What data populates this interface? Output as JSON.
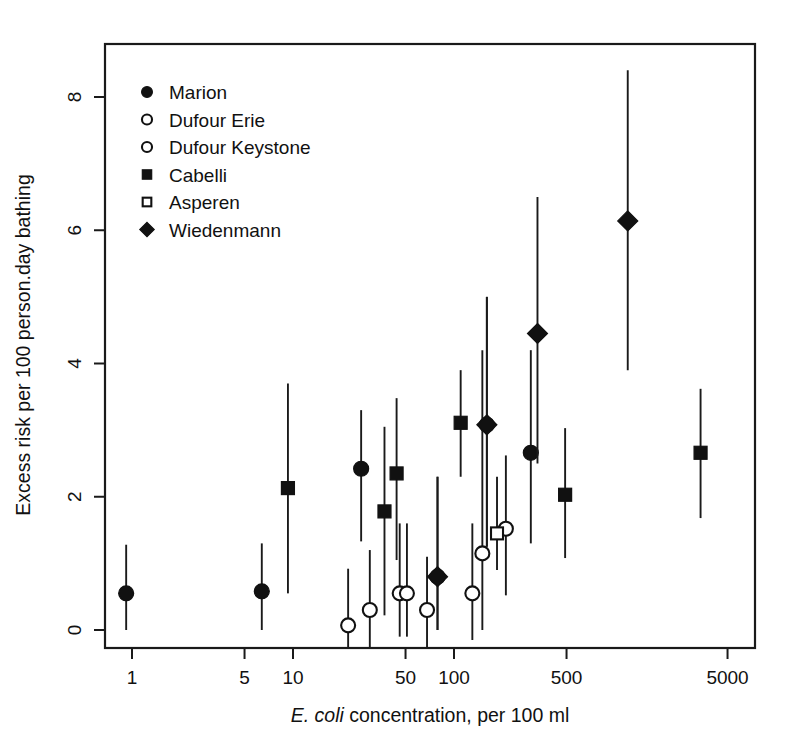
{
  "chart_data": {
    "type": "scatter",
    "title": "",
    "xlabel": "E. coli concentration, per 100 ml",
    "xlabel_italic_part": "E. coli",
    "xlabel_rest": " concentration, per 100 ml",
    "ylabel": "Excess risk per 100 person.day bathing",
    "xscale": "log",
    "yscale": "linear",
    "xlim": [
      0.62,
      8000
    ],
    "ylim": [
      -0.55,
      9.05
    ],
    "xticks": [
      1,
      5,
      10,
      50,
      100,
      500,
      5000
    ],
    "xticklabels": [
      "1",
      "5",
      "10",
      "50",
      "100",
      "500",
      "5000"
    ],
    "yticks": [
      0,
      2,
      4,
      6,
      8
    ],
    "yticklabels": [
      "0",
      "2",
      "4",
      "6",
      "8"
    ],
    "grid": false,
    "errorbars": "vertical 95% confidence intervals",
    "legend_position": "top-left inside plot",
    "series": [
      {
        "name": "Marion",
        "marker": "filled-circle",
        "points": [
          {
            "x": 0.92,
            "y": 0.55,
            "lo": 0.0,
            "hi": 1.28
          },
          {
            "x": 6.4,
            "y": 0.58,
            "lo": 0.0,
            "hi": 1.3
          },
          {
            "x": 26.5,
            "y": 2.42,
            "lo": 1.33,
            "hi": 3.3
          },
          {
            "x": 79.0,
            "y": 0.8,
            "lo": 0.0,
            "hi": 2.3
          },
          {
            "x": 160.0,
            "y": 3.08,
            "lo": 1.25,
            "hi": 5.0
          },
          {
            "x": 300.0,
            "y": 2.66,
            "lo": 1.3,
            "hi": 4.2
          }
        ]
      },
      {
        "name": "Dufour Erie",
        "marker": "open-circle",
        "points": [
          {
            "x": 22.0,
            "y": 0.07,
            "lo": -0.5,
            "hi": 0.92
          },
          {
            "x": 30.0,
            "y": 0.3,
            "lo": -0.35,
            "hi": 1.2
          },
          {
            "x": 46.0,
            "y": 0.55,
            "lo": -0.1,
            "hi": 1.6
          },
          {
            "x": 51.0,
            "y": 0.55,
            "lo": -0.1,
            "hi": 1.6
          },
          {
            "x": 130.0,
            "y": 0.55,
            "lo": -0.15,
            "hi": 1.6
          }
        ]
      },
      {
        "name": "Dufour Keystone",
        "marker": "open-circle",
        "points": [
          {
            "x": 68.0,
            "y": 0.3,
            "lo": -0.45,
            "hi": 1.1
          },
          {
            "x": 150.0,
            "y": 1.15,
            "lo": 0.0,
            "hi": 4.2
          },
          {
            "x": 210.0,
            "y": 1.52,
            "lo": 0.52,
            "hi": 2.62
          }
        ]
      },
      {
        "name": "Cabelli",
        "marker": "filled-square",
        "points": [
          {
            "x": 9.3,
            "y": 2.13,
            "lo": 0.55,
            "hi": 3.7
          },
          {
            "x": 37.0,
            "y": 1.78,
            "lo": 0.22,
            "hi": 3.05
          },
          {
            "x": 44.0,
            "y": 2.35,
            "lo": 1.05,
            "hi": 3.48
          },
          {
            "x": 110.0,
            "y": 3.11,
            "lo": 2.3,
            "hi": 3.9
          },
          {
            "x": 490.0,
            "y": 2.03,
            "lo": 1.08,
            "hi": 3.03
          },
          {
            "x": 3400.0,
            "y": 2.66,
            "lo": 1.68,
            "hi": 3.62
          }
        ]
      },
      {
        "name": "Asperen",
        "marker": "open-square",
        "points": [
          {
            "x": 185.0,
            "y": 1.45,
            "lo": 0.9,
            "hi": 2.3
          }
        ]
      },
      {
        "name": "Wiedenmann",
        "marker": "filled-diamond",
        "points": [
          {
            "x": 79.0,
            "y": 0.8,
            "lo": 0.0,
            "hi": 2.3
          },
          {
            "x": 160.0,
            "y": 3.08,
            "lo": 1.25,
            "hi": 5.0
          },
          {
            "x": 330.0,
            "y": 4.45,
            "lo": 2.5,
            "hi": 6.5
          },
          {
            "x": 1200.0,
            "y": 6.14,
            "lo": 3.9,
            "hi": 8.4
          }
        ]
      }
    ]
  },
  "legend": {
    "items": [
      {
        "label": "Marion",
        "marker": "filled-circle"
      },
      {
        "label": "Dufour Erie",
        "marker": "open-circle"
      },
      {
        "label": "Dufour Keystone",
        "marker": "open-circle"
      },
      {
        "label": "Cabelli",
        "marker": "filled-square"
      },
      {
        "label": "Asperen",
        "marker": "open-square"
      },
      {
        "label": "Wiedenmann",
        "marker": "filled-diamond"
      }
    ]
  },
  "colors": {
    "ink": "#111111",
    "background": "#ffffff"
  }
}
